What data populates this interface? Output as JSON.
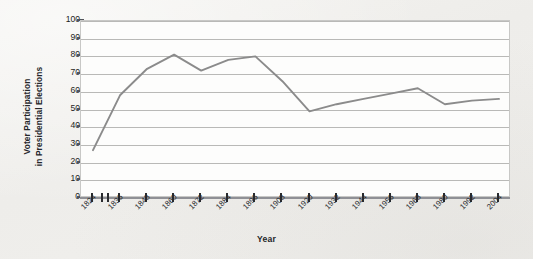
{
  "chart_data": {
    "type": "line",
    "title": "",
    "xlabel": "Year",
    "ylabel": "Voter Participation in Presidential Elections",
    "ylabel_line1": "Voter Participation",
    "ylabel_line2": "in Presidential Elections",
    "ylim": [
      0,
      100
    ],
    "ytick_labels": [
      "100",
      "90",
      "80",
      "70",
      "60",
      "50",
      "40",
      "30",
      "20",
      "10",
      "0"
    ],
    "ytick_values": [
      100,
      90,
      80,
      70,
      60,
      50,
      40,
      30,
      20,
      10,
      0
    ],
    "grid": "horizontal",
    "legend": "none",
    "line_color": "#8b8b8b",
    "categories": [
      "1824",
      "1836",
      "1848",
      "1860",
      "1872",
      "1884",
      "1896",
      "1908",
      "1920",
      "1932",
      "1944",
      "1956",
      "1968",
      "1980",
      "1992",
      "2004"
    ],
    "values": [
      27,
      58,
      73,
      81,
      72,
      78,
      80,
      66,
      49,
      53,
      56,
      59,
      62,
      53,
      55,
      56
    ],
    "series": [
      {
        "name": "Voter participation",
        "values": [
          27,
          58,
          73,
          81,
          72,
          78,
          80,
          66,
          49,
          53,
          56,
          59,
          62,
          53,
          55,
          56
        ]
      }
    ],
    "annotations": []
  },
  "axes": {
    "x_title": "Year",
    "y_title_line1": "Voter Participation",
    "y_title_line2": "in Presidential Elections"
  },
  "style": {
    "page_background": "#f1f0ed",
    "plot_background": "#fdfdfc",
    "gridline_color": "#b9b9b7",
    "axis_color": "#8f9095",
    "tick_color": "#2b2c30",
    "line_color": "#8b8b8b",
    "text_color": "#25262a"
  }
}
